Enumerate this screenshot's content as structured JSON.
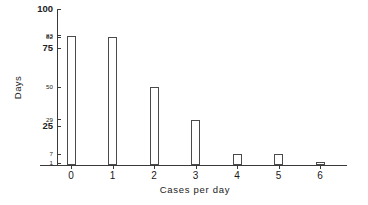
{
  "chart_data": {
    "type": "bar",
    "title": "",
    "xlabel": "Cases per day",
    "ylabel": "Days",
    "categories": [
      "0",
      "1",
      "2",
      "3",
      "4",
      "5",
      "6"
    ],
    "values": [
      83,
      82,
      50,
      29,
      7,
      7,
      2
    ],
    "series": [
      {
        "name": "Days",
        "values": [
          83,
          82,
          50,
          29,
          7,
          7,
          2
        ]
      }
    ],
    "ylim": [
      0,
      100
    ],
    "xlim": [
      -0.6,
      6.6
    ],
    "grid": false,
    "legend": null,
    "bar_style": "open-outline",
    "y_ticks": [
      {
        "value": 100,
        "label": "100",
        "emphasis": "major"
      },
      {
        "value": 83,
        "label": "83",
        "emphasis": "minor"
      },
      {
        "value": 82,
        "label": "82",
        "emphasis": "minor"
      },
      {
        "value": 75,
        "label": "75",
        "emphasis": "major"
      },
      {
        "value": 50,
        "label": "50",
        "emphasis": "minor"
      },
      {
        "value": 29,
        "label": "29",
        "emphasis": "minor"
      },
      {
        "value": 25,
        "label": "25",
        "emphasis": "major"
      },
      {
        "value": 7,
        "label": "7",
        "emphasis": "minor"
      },
      {
        "value": 1,
        "label": "1",
        "emphasis": "minor"
      }
    ],
    "x_ticks": [
      "0",
      "1",
      "2",
      "3",
      "4",
      "5",
      "6"
    ],
    "colors": {
      "axis": "#3a3a3a",
      "bar_outline": "#4a4a4a",
      "bar_fill": "#ffffff",
      "text": "#1a1a1a",
      "background": "#ffffff"
    }
  }
}
